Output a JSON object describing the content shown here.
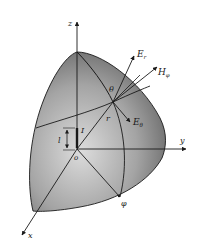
{
  "figure": {
    "colors": {
      "surface_light": "#d8d8d8",
      "surface_dark": "#5e5e5e",
      "line": "#1a1a1a",
      "background": "#ffffff"
    },
    "axes": {
      "x_label": "x",
      "y_label": "y",
      "z_label": "z",
      "origin_label": "o"
    },
    "source": {
      "current_label": "I",
      "length_label": "l"
    },
    "field": {
      "radius_label": "r",
      "theta_label": "θ",
      "phi_label": "φ",
      "vectors": [
        {
          "name": "E_r",
          "base": "E",
          "sub": "r"
        },
        {
          "name": "H_phi",
          "base": "H",
          "sub": "φ"
        },
        {
          "name": "E_theta",
          "base": "E",
          "sub": "θ"
        }
      ]
    }
  }
}
